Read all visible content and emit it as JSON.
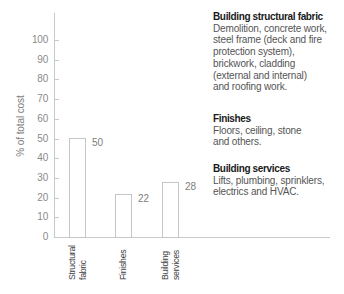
{
  "chart_data": {
    "type": "bar",
    "title": "",
    "xlabel": "",
    "ylabel": "% of total cost",
    "ylim": [
      0,
      100
    ],
    "yticks": [
      0,
      10,
      20,
      30,
      40,
      50,
      60,
      70,
      80,
      90,
      100
    ],
    "grid": false,
    "legend": null,
    "categories": [
      "Structural fabric",
      "Finishes",
      "Building services"
    ],
    "category_lines": [
      [
        "Structural",
        "fabric"
      ],
      [
        "Finishes"
      ],
      [
        "Building",
        "services"
      ]
    ],
    "values": [
      50,
      22,
      28
    ],
    "bar_value_labels": [
      "50",
      "22",
      "28"
    ]
  },
  "annotations": [
    {
      "heading": "Building structural fabric",
      "body": [
        "Demolition, concrete work,",
        "steel frame (deck and fire",
        "protection system),",
        "brickwork, cladding",
        "(external and internal)",
        "and roofing work."
      ]
    },
    {
      "heading": "Finishes",
      "body": [
        "Floors, ceiling, stone",
        "and others."
      ]
    },
    {
      "heading": "Building services",
      "body": [
        "Lifts, plumbing, sprinklers,",
        "electrics and HVAC."
      ]
    }
  ],
  "colors": {
    "background": "#ffffff",
    "axis": "#c9c9c9",
    "bar_fill": "#ffffff",
    "bar_outline": "#c5c5c5",
    "tick_label": "#8a8a8a",
    "value_label": "#7d7d7d",
    "axis_title": "#7d7d7d",
    "category_label": "#3d3d3d",
    "heading": "#1a1a1a",
    "body": "#555555"
  }
}
